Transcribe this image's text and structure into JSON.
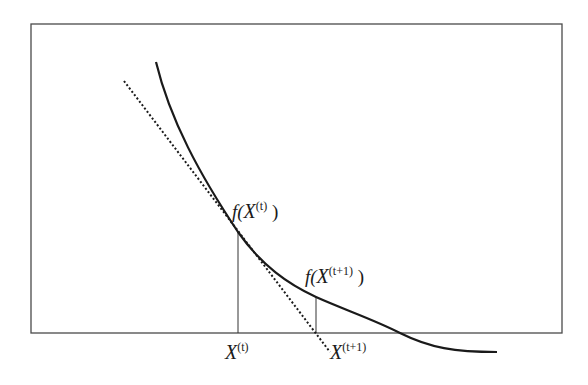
{
  "diagram": {
    "labels": {
      "f_xt": {
        "prefix": "f(",
        "var": "X",
        "sup": "(t)",
        "suffix": " )"
      },
      "f_xt1": {
        "prefix": "f(",
        "var": "X",
        "sup": "(t+1)",
        "suffix": " )"
      },
      "xt": {
        "var": "X",
        "sup": "(t)"
      },
      "xt1": {
        "var": "X",
        "sup": "(t+1)"
      }
    },
    "elements": {
      "curve": "function f(x) (convex decreasing curve)",
      "tangent": "tangent line at X(t) (dotted)",
      "frame": "axes box"
    },
    "colors": {
      "line": "#1a1a1a",
      "frame": "#4a4a4a",
      "background": "#ffffff"
    }
  }
}
